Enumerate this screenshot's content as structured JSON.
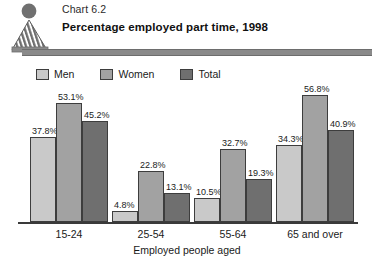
{
  "header": {
    "logo_icon": "statistics-person-logo",
    "chart_number": "Chart 6.2",
    "title": "Percentage employed part time, 1998"
  },
  "legend": {
    "items": [
      {
        "label": "Men",
        "color": "#c9c9c9"
      },
      {
        "label": "Women",
        "color": "#a2a2a2"
      },
      {
        "label": "Total",
        "color": "#6f6f6f"
      }
    ]
  },
  "chart_data": {
    "type": "bar",
    "title": "Percentage employed part time, 1998",
    "subtitle": "Chart 6.2",
    "xlabel": "Employed people aged",
    "ylabel": "",
    "ylim": [
      0,
      58
    ],
    "grid": false,
    "legend_position": "top-left",
    "categories": [
      "15-24",
      "25-54",
      "55-64",
      "65 and over"
    ],
    "series": [
      {
        "name": "Men",
        "color": "#c9c9c9",
        "values": [
          37.8,
          4.8,
          10.5,
          34.3
        ],
        "labels": [
          "37.8%",
          "4.8%",
          "10.5%",
          "34.3%"
        ]
      },
      {
        "name": "Women",
        "color": "#a2a2a2",
        "values": [
          53.1,
          22.8,
          32.7,
          56.8
        ],
        "labels": [
          "53.1%",
          "22.8%",
          "32.7%",
          "56.8%"
        ]
      },
      {
        "name": "Total",
        "color": "#6f6f6f",
        "values": [
          45.2,
          13.1,
          19.3,
          40.9
        ],
        "labels": [
          "45.2%",
          "13.1%",
          "19.3%",
          "40.9%"
        ]
      }
    ]
  }
}
